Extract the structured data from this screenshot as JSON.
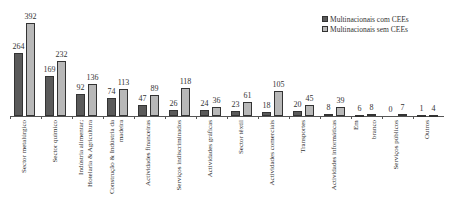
{
  "chart_data": {
    "type": "bar",
    "title": "",
    "xlabel": "",
    "ylabel": "",
    "ylim": [
      0,
      400
    ],
    "grid": false,
    "legend_position": "top-right",
    "categories": [
      "Sector metalúrgico",
      "Sector químico",
      "Indústria alimentar;\nHotelaria & Agricultura",
      "Construção & Indústria da\nmadeira",
      "Actividades financeiras",
      "Serviços indiscriminados",
      "Actividades gráficas",
      "Sector têxtil",
      "Actividades comerciais",
      "Transportes",
      "Actividades informáticas",
      "Em\n\nbranco",
      "Serviços públicos",
      "Outros"
    ],
    "series": [
      {
        "name": "Multinacionais com CEEs",
        "color": "#5a5a5a",
        "values": [
          264,
          169,
          92,
          74,
          47,
          26,
          24,
          23,
          18,
          20,
          8,
          6,
          0,
          1
        ]
      },
      {
        "name": "Multinacionais sem CEEs",
        "color": "#b8b8b8",
        "values": [
          392,
          232,
          136,
          113,
          89,
          118,
          36,
          61,
          105,
          45,
          39,
          8,
          7,
          4
        ]
      }
    ]
  },
  "legend": {
    "items": [
      {
        "label": "Multinacionais com CEEs",
        "style": "dark"
      },
      {
        "label": "Multinacionais sem CEEs",
        "style": "light"
      }
    ]
  }
}
